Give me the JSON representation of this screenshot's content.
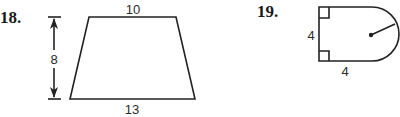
{
  "problems": [
    {
      "number": "18.",
      "shape": "trapezoid",
      "labels": {
        "top": "10",
        "bottom": "13",
        "height": "8"
      }
    },
    {
      "number": "19.",
      "shape": "square-with-semicircle",
      "labels": {
        "left": "4",
        "bottom": "4"
      }
    }
  ],
  "colors": {
    "ink": "#222222",
    "background": "#ffffff"
  }
}
